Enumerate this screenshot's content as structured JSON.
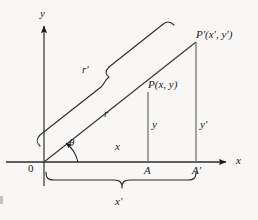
{
  "figure": {
    "kind": "geometry-diagram",
    "background_color": "#f8f7f5",
    "ink_color": "#1a1a1a",
    "axes": {
      "y_axis_label": "y",
      "x_axis_label": "x",
      "origin_label": "0"
    },
    "angle_label": "θ",
    "points": {
      "inner_point_label": "P(x, y)",
      "outer_point_label": "P'(x', y')",
      "foot_inner_label": "A",
      "foot_outer_label": "A'"
    },
    "segments": {
      "radius_inner_label": "r",
      "radius_outer_label": "r'",
      "abscissa_inner_label": "x",
      "ordinate_inner_label": "y",
      "ordinate_outer_label": "y'",
      "abscissa_outer_label": "x'"
    },
    "geometry": {
      "origin_x": 44,
      "origin_y": 162,
      "x_axis_end_x": 232,
      "y_axis_top_y": 22,
      "point_p_x": 148,
      "point_p_y": 92,
      "point_p_prime_x": 196,
      "point_p_prime_y": 42
    }
  }
}
